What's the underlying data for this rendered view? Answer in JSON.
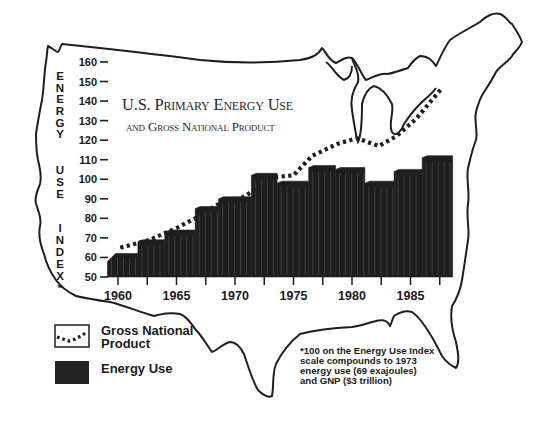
{
  "chart_data": {
    "type": "bar",
    "title": "U.S. Primary Energy Use",
    "subtitle": "and Gross National Product",
    "ylabel": "Energy Use Index*",
    "xlabel": "",
    "ylim": [
      50,
      160
    ],
    "y_ticks": [
      50,
      60,
      70,
      80,
      90,
      100,
      110,
      120,
      130,
      140,
      150,
      160
    ],
    "x_tick_labels": [
      "1960",
      "1965",
      "1970",
      "1975",
      "1980",
      "1985"
    ],
    "x_tick_years": [
      1960,
      1965,
      1970,
      1975,
      1980,
      1985
    ],
    "x_minor_ticks": [
      1960,
      1962.5,
      1965,
      1967.5,
      1970,
      1972.5,
      1975,
      1977.5,
      1980,
      1982.5,
      1985,
      1987.5
    ],
    "grid": false,
    "legend_position": "bottom-left",
    "series": [
      {
        "name": "Energy Use",
        "kind": "bar",
        "color": "#1e1e1e",
        "bars": [
          {
            "from": 1959.1,
            "to": 1961.7,
            "value": 62
          },
          {
            "from": 1961.7,
            "to": 1964.0,
            "value": 68
          },
          {
            "from": 1964.0,
            "to": 1966.6,
            "value": 73
          },
          {
            "from": 1966.6,
            "to": 1968.6,
            "value": 85
          },
          {
            "from": 1968.6,
            "to": 1971.4,
            "value": 90
          },
          {
            "from": 1971.4,
            "to": 1973.6,
            "value": 102
          },
          {
            "from": 1973.6,
            "to": 1976.3,
            "value": 98
          },
          {
            "from": 1976.3,
            "to": 1978.6,
            "value": 106
          },
          {
            "from": 1978.6,
            "to": 1981.1,
            "value": 105
          },
          {
            "from": 1981.1,
            "to": 1983.6,
            "value": 98
          },
          {
            "from": 1983.6,
            "to": 1986.0,
            "value": 104
          },
          {
            "from": 1986.0,
            "to": 1988.6,
            "value": 111
          }
        ]
      },
      {
        "name": "Gross National Product",
        "kind": "line",
        "style": "dotted",
        "color": "#1e1e1e",
        "points": [
          {
            "x": 1960.2,
            "y": 65
          },
          {
            "x": 1962.7,
            "y": 69
          },
          {
            "x": 1965.0,
            "y": 75
          },
          {
            "x": 1966.6,
            "y": 80
          },
          {
            "x": 1968.5,
            "y": 87
          },
          {
            "x": 1970.8,
            "y": 91
          },
          {
            "x": 1972.2,
            "y": 97
          },
          {
            "x": 1973.3,
            "y": 101
          },
          {
            "x": 1975.0,
            "y": 102
          },
          {
            "x": 1976.6,
            "y": 112
          },
          {
            "x": 1978.7,
            "y": 118
          },
          {
            "x": 1980.4,
            "y": 121
          },
          {
            "x": 1982.3,
            "y": 117
          },
          {
            "x": 1983.8,
            "y": 122
          },
          {
            "x": 1985.5,
            "y": 131
          },
          {
            "x": 1987.6,
            "y": 146
          }
        ]
      }
    ],
    "footnote": "*100 on the Energy Use Index scale compounds to 1973 energy use (69 exajoules) and GNP ($3 trillion)"
  },
  "title": {
    "line1_caps": [
      "U",
      ".S. ",
      "P",
      "RIMARY ",
      "E",
      "NERGY ",
      "U",
      "SE"
    ],
    "line1": "U.S. Primary Energy Use",
    "line2": "and Gross National Product"
  },
  "yaxis": {
    "letters": [
      "E",
      "N",
      "E",
      "R",
      "G",
      "Y",
      "U",
      "S",
      "E",
      "I",
      "N",
      "D",
      "E",
      "X",
      "*"
    ]
  },
  "legend": {
    "gnp_line1": "Gross National",
    "gnp_line2": "Product",
    "energy": "Energy Use"
  },
  "footnote_lines": [
    "*100 on the Energy Use Index",
    "scale compounds to 1973",
    "energy use (69 exajoules)",
    "and GNP ($3 trillion)"
  ]
}
